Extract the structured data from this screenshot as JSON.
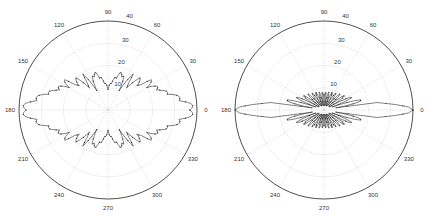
{
  "chart_data": [
    {
      "type": "polar-line",
      "title": "",
      "center_px": [
        108,
        110
      ],
      "radius_px": 89,
      "rlim": [
        0,
        40
      ],
      "radial_ticks": [
        10,
        20,
        30,
        40
      ],
      "angle_ticks_deg": [
        0,
        30,
        60,
        90,
        120,
        150,
        180,
        210,
        240,
        270,
        300,
        330
      ],
      "angle_tick_labels": [
        "0",
        "30",
        "60",
        "90",
        "120",
        "150",
        "180",
        "210",
        "240",
        "270",
        "300",
        "330"
      ],
      "radial_tick_labels": [
        "10",
        "20",
        "30",
        "40"
      ],
      "grid": true,
      "series": [
        {
          "name": "pattern-1",
          "description": "Lobed radiation pattern, symmetric about both axes; max ~40 at 0/180 deg, dip ~10 at 90/270 deg, main lobes near 71/109 deg at ~18",
          "points_deg_r": [
            [
              0,
              40
            ],
            [
              5,
              37
            ],
            [
              10,
              33
            ],
            [
              15,
              30
            ],
            [
              20,
              26
            ],
            [
              25,
              25
            ],
            [
              30,
              22
            ],
            [
              35,
              24
            ],
            [
              40,
              17
            ],
            [
              45,
              22
            ],
            [
              50,
              13
            ],
            [
              55,
              20
            ],
            [
              60,
              11
            ],
            [
              65,
              17
            ],
            [
              71,
              18
            ],
            [
              80,
              14
            ],
            [
              90,
              10
            ],
            [
              100,
              14
            ],
            [
              109,
              18
            ],
            [
              115,
              17
            ],
            [
              120,
              11
            ],
            [
              125,
              20
            ],
            [
              130,
              13
            ],
            [
              135,
              22
            ],
            [
              140,
              17
            ],
            [
              145,
              24
            ],
            [
              150,
              22
            ],
            [
              155,
              25
            ],
            [
              160,
              26
            ],
            [
              165,
              30
            ],
            [
              170,
              33
            ],
            [
              175,
              37
            ],
            [
              180,
              40
            ]
          ]
        }
      ]
    },
    {
      "type": "polar-line",
      "title": "",
      "center_px": [
        324,
        110
      ],
      "radius_px": 89,
      "rlim": [
        0,
        40
      ],
      "radial_ticks": [
        10,
        20,
        30,
        40
      ],
      "angle_ticks_deg": [
        0,
        30,
        60,
        90,
        120,
        150,
        180,
        210,
        240,
        270,
        300,
        330
      ],
      "angle_tick_labels": [
        "0",
        "30",
        "60",
        "90",
        "120",
        "150",
        "180",
        "210",
        "240",
        "270",
        "300",
        "330"
      ],
      "radial_tick_labels": [
        "10",
        "20",
        "30",
        "40"
      ],
      "grid": true,
      "series": [
        {
          "name": "pattern-2",
          "description": "Dense bow-tie pattern with many fine lobes; narrow main beam reaching 40 at 0/180 deg, envelope ~16 near 20 deg, cusps ~8 at 90/270 deg",
          "points_deg_r": [
            [
              0,
              40
            ],
            [
              2,
              38
            ],
            [
              4,
              33
            ],
            [
              6,
              28
            ],
            [
              8,
              24
            ],
            [
              10,
              21
            ],
            [
              15,
              17
            ],
            [
              20,
              15
            ],
            [
              30,
              12
            ],
            [
              40,
              10.5
            ],
            [
              50,
              9.5
            ],
            [
              60,
              9
            ],
            [
              70,
              8.5
            ],
            [
              80,
              8
            ],
            [
              90,
              8
            ],
            [
              100,
              8
            ],
            [
              110,
              8.5
            ],
            [
              120,
              9
            ],
            [
              130,
              9.5
            ],
            [
              140,
              10.5
            ],
            [
              150,
              12
            ],
            [
              160,
              15
            ],
            [
              165,
              17
            ],
            [
              170,
              21
            ],
            [
              172,
              24
            ],
            [
              174,
              28
            ],
            [
              176,
              33
            ],
            [
              178,
              38
            ],
            [
              180,
              40
            ]
          ]
        }
      ]
    }
  ],
  "plots": [
    {
      "angle_labels": [
        "0",
        "30",
        "60",
        "90",
        "120",
        "150",
        "180",
        "210",
        "240",
        "270",
        "300",
        "330"
      ],
      "radial_labels": [
        "10",
        "20",
        "30",
        "40"
      ]
    },
    {
      "angle_labels": [
        "0",
        "30",
        "60",
        "90",
        "120",
        "150",
        "180",
        "210",
        "240",
        "270",
        "300",
        "330"
      ],
      "radial_labels": [
        "10",
        "20",
        "30",
        "40"
      ]
    }
  ]
}
